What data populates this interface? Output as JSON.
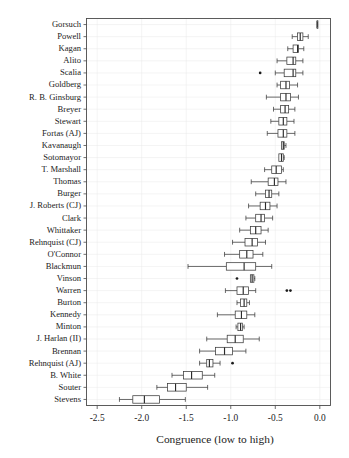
{
  "figure": {
    "background": "#ffffff",
    "frame_color": "#4a4a4a",
    "grid_color": "#e8e8e8",
    "box_fill": "#ffffff",
    "box_stroke": "#3a3a3a"
  },
  "axis": {
    "x_title": "Congruence (low to high)",
    "x_ticks": [
      "-2.5",
      "-2.0",
      "-1.5",
      "-1.0",
      "-0.5",
      "0.0"
    ],
    "x_tick_values": [
      -2.5,
      -2.0,
      -1.5,
      -1.0,
      -0.5,
      0.0
    ],
    "xlim": [
      -2.62,
      0.12
    ],
    "y_title": ""
  },
  "chart_data": {
    "type": "boxplot",
    "title": "",
    "xlabel": "Congruence (low to high)",
    "ylabel": "",
    "xlim": [
      -2.62,
      0.12
    ],
    "grid": true,
    "legend": "none",
    "orientation": "horizontal",
    "categories": [
      "Gorsuch",
      "Powell",
      "Kagan",
      "Alito",
      "Scalia",
      "Goldberg",
      "R. B. Ginsburg",
      "Breyer",
      "Stewart",
      "Fortas (AJ)",
      "Kavanaugh",
      "Sotomayor",
      "T. Marshall",
      "Thomas",
      "Burger",
      "J. Roberts (CJ)",
      "Clark",
      "Whittaker",
      "Rehnquist (CJ)",
      "O'Connor",
      "Blackmun",
      "Vinson",
      "Warren",
      "Burton",
      "Kennedy",
      "Minton",
      "J. Harlan (II)",
      "Brennan",
      "Rehnquist (AJ)",
      "B. White",
      "Souter",
      "Stevens"
    ],
    "boxes": [
      {
        "label": "Gorsuch",
        "lower_whisker": -0.03,
        "q1": -0.03,
        "median": -0.03,
        "q3": -0.03,
        "upper_whisker": -0.03,
        "outliers": []
      },
      {
        "label": "Powell",
        "lower_whisker": -0.31,
        "q1": -0.25,
        "median": -0.22,
        "q3": -0.19,
        "upper_whisker": -0.13,
        "outliers": []
      },
      {
        "label": "Kagan",
        "lower_whisker": -0.36,
        "q1": -0.3,
        "median": -0.25,
        "q3": -0.24,
        "upper_whisker": -0.18,
        "outliers": []
      },
      {
        "label": "Alito",
        "lower_whisker": -0.48,
        "q1": -0.37,
        "median": -0.3,
        "q3": -0.27,
        "upper_whisker": -0.19,
        "outliers": []
      },
      {
        "label": "Scalia",
        "lower_whisker": -0.5,
        "q1": -0.4,
        "median": -0.3,
        "q3": -0.27,
        "upper_whisker": -0.19,
        "outliers": [
          -0.67
        ]
      },
      {
        "label": "Goldberg",
        "lower_whisker": -0.48,
        "q1": -0.44,
        "median": -0.38,
        "q3": -0.34,
        "upper_whisker": -0.25,
        "outliers": []
      },
      {
        "label": "R. B. Ginsburg",
        "lower_whisker": -0.6,
        "q1": -0.44,
        "median": -0.38,
        "q3": -0.33,
        "upper_whisker": -0.24,
        "outliers": []
      },
      {
        "label": "Breyer",
        "lower_whisker": -0.52,
        "q1": -0.44,
        "median": -0.39,
        "q3": -0.35,
        "upper_whisker": -0.28,
        "outliers": []
      },
      {
        "label": "Stewart",
        "lower_whisker": -0.55,
        "q1": -0.46,
        "median": -0.41,
        "q3": -0.37,
        "upper_whisker": -0.29,
        "outliers": []
      },
      {
        "label": "Fortas (AJ)",
        "lower_whisker": -0.59,
        "q1": -0.47,
        "median": -0.41,
        "q3": -0.37,
        "upper_whisker": -0.28,
        "outliers": []
      },
      {
        "label": "Kavanaugh",
        "lower_whisker": -0.43,
        "q1": -0.43,
        "median": -0.41,
        "q3": -0.4,
        "upper_whisker": -0.38,
        "outliers": []
      },
      {
        "label": "Sotomayor",
        "lower_whisker": -0.46,
        "q1": -0.46,
        "median": -0.43,
        "q3": -0.41,
        "upper_whisker": -0.4,
        "outliers": []
      },
      {
        "label": "T. Marshall",
        "lower_whisker": -0.62,
        "q1": -0.54,
        "median": -0.49,
        "q3": -0.43,
        "upper_whisker": -0.41,
        "outliers": []
      },
      {
        "label": "Thomas",
        "lower_whisker": -0.77,
        "q1": -0.58,
        "median": -0.51,
        "q3": -0.47,
        "upper_whisker": -0.38,
        "outliers": []
      },
      {
        "label": "Burger",
        "lower_whisker": -0.72,
        "q1": -0.61,
        "median": -0.57,
        "q3": -0.54,
        "upper_whisker": -0.46,
        "outliers": []
      },
      {
        "label": "J. Roberts (CJ)",
        "lower_whisker": -0.8,
        "q1": -0.67,
        "median": -0.61,
        "q3": -0.56,
        "upper_whisker": -0.48,
        "outliers": []
      },
      {
        "label": "Clark",
        "lower_whisker": -0.83,
        "q1": -0.72,
        "median": -0.66,
        "q3": -0.62,
        "upper_whisker": -0.53,
        "outliers": []
      },
      {
        "label": "Whittaker",
        "lower_whisker": -0.9,
        "q1": -0.78,
        "median": -0.72,
        "q3": -0.66,
        "upper_whisker": -0.58,
        "outliers": []
      },
      {
        "label": "Rehnquist (CJ)",
        "lower_whisker": -0.98,
        "q1": -0.84,
        "median": -0.76,
        "q3": -0.7,
        "upper_whisker": -0.61,
        "outliers": []
      },
      {
        "label": "O'Connor",
        "lower_whisker": -1.07,
        "q1": -0.9,
        "median": -0.82,
        "q3": -0.75,
        "upper_whisker": -0.64,
        "outliers": []
      },
      {
        "label": "Blackmun",
        "lower_whisker": -1.48,
        "q1": -1.05,
        "median": -0.85,
        "q3": -0.72,
        "upper_whisker": -0.54,
        "outliers": []
      },
      {
        "label": "Vinson",
        "lower_whisker": -0.78,
        "q1": -0.78,
        "median": -0.76,
        "q3": -0.74,
        "upper_whisker": -0.73,
        "outliers": [
          -0.93
        ]
      },
      {
        "label": "Warren",
        "lower_whisker": -1.06,
        "q1": -0.93,
        "median": -0.86,
        "q3": -0.8,
        "upper_whisker": -0.72,
        "outliers": [
          -0.37,
          -0.33
        ]
      },
      {
        "label": "Burton",
        "lower_whisker": -0.93,
        "q1": -0.89,
        "median": -0.85,
        "q3": -0.82,
        "upper_whisker": -0.79,
        "outliers": []
      },
      {
        "label": "Kennedy",
        "lower_whisker": -1.15,
        "q1": -0.95,
        "median": -0.88,
        "q3": -0.82,
        "upper_whisker": -0.73,
        "outliers": []
      },
      {
        "label": "Minton",
        "lower_whisker": -0.94,
        "q1": -0.92,
        "median": -0.89,
        "q3": -0.87,
        "upper_whisker": -0.85,
        "outliers": []
      },
      {
        "label": "J. Harlan (II)",
        "lower_whisker": -1.27,
        "q1": -1.04,
        "median": -0.95,
        "q3": -0.86,
        "upper_whisker": -0.68,
        "outliers": []
      },
      {
        "label": "Brennan",
        "lower_whisker": -1.35,
        "q1": -1.17,
        "median": -1.07,
        "q3": -0.98,
        "upper_whisker": -0.83,
        "outliers": []
      },
      {
        "label": "Rehnquist (AJ)",
        "lower_whisker": -1.35,
        "q1": -1.27,
        "median": -1.24,
        "q3": -1.2,
        "upper_whisker": -1.12,
        "outliers": [
          -0.98
        ]
      },
      {
        "label": "B. White",
        "lower_whisker": -1.66,
        "q1": -1.53,
        "median": -1.44,
        "q3": -1.32,
        "upper_whisker": -1.18,
        "outliers": []
      },
      {
        "label": "Souter",
        "lower_whisker": -1.83,
        "q1": -1.71,
        "median": -1.62,
        "q3": -1.5,
        "upper_whisker": -1.26,
        "outliers": []
      },
      {
        "label": "Stevens",
        "lower_whisker": -2.25,
        "q1": -2.1,
        "median": -1.97,
        "q3": -1.8,
        "upper_whisker": -1.51,
        "outliers": []
      }
    ]
  }
}
